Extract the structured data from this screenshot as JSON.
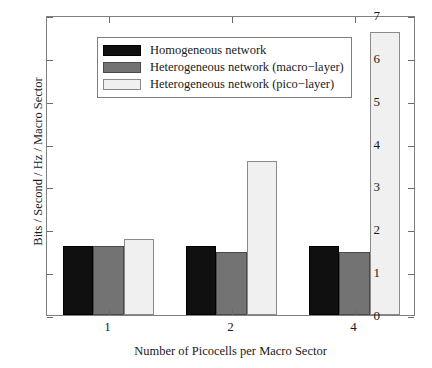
{
  "chart_data": {
    "type": "bar",
    "title": "",
    "xlabel": "Number of Picocells per Macro Sector",
    "ylabel": "Bits / Second / Hz / Macro Sector",
    "categories": [
      "1",
      "2",
      "4"
    ],
    "series": [
      {
        "name": "Homogeneous network",
        "color": "#101010",
        "values": [
          1.6,
          1.6,
          1.6
        ]
      },
      {
        "name": "Heterogeneous network (macro−layer)",
        "color": "#737373",
        "values": [
          1.6,
          1.48,
          1.48
        ]
      },
      {
        "name": "Heterogeneous network (pico−layer)",
        "color": "#f0f0f0",
        "values": [
          1.78,
          3.6,
          6.6
        ]
      }
    ],
    "ylim": [
      0,
      7
    ],
    "yticks": [
      "0",
      "1",
      "2",
      "3",
      "4",
      "5",
      "6",
      "7"
    ],
    "grid": false,
    "legend_position": "top-left",
    "axis_color": "#808080"
  },
  "legend": {
    "entries": [
      "Homogeneous network",
      "Heterogeneous network (macro−layer)",
      "Heterogeneous network (pico−layer)"
    ]
  }
}
